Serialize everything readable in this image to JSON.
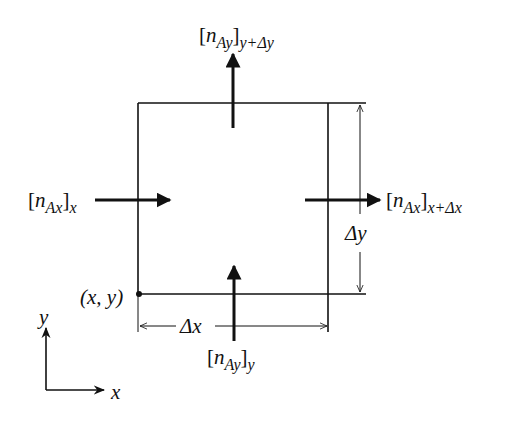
{
  "diagram": {
    "flux_labels": {
      "top": {
        "bracket_open": "[",
        "n": "n",
        "sub": "Ay",
        "bracket_close": "]",
        "eval": "y+Δy"
      },
      "bottom": {
        "bracket_open": "[",
        "n": "n",
        "sub": "Ay",
        "bracket_close": "]",
        "eval": "y"
      },
      "left": {
        "bracket_open": "[",
        "n": "n",
        "sub": "Ax",
        "bracket_close": "]",
        "eval": "x"
      },
      "right": {
        "bracket_open": "[",
        "n": "n",
        "sub": "Ax",
        "bracket_close": "]",
        "eval": "x+Δx"
      }
    },
    "corner_label": "(x, y)",
    "dimension_x": "Δx",
    "dimension_y": "Δy",
    "axes": {
      "x_label": "x",
      "y_label": "y"
    },
    "colors": {
      "line": "#111111",
      "background": "#ffffff"
    }
  }
}
